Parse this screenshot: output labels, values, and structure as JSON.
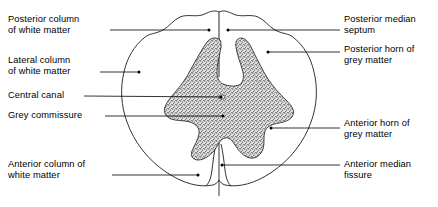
{
  "diagram": {
    "colors": {
      "background": "#ffffff",
      "outline": "#000000",
      "grey_matter_fill": "#d9d9d9",
      "grey_matter_stipple": "#3a3a3a",
      "leader_line": "#000000",
      "text": "#000000"
    }
  },
  "labels": {
    "left": [
      {
        "id": "posterior-column-white-matter",
        "text": "Posterior column\nof white matter",
        "x": 8,
        "y": 14,
        "leader": {
          "x1": 110,
          "y1": 30,
          "x2": 209,
          "y2": 30,
          "dot": "end"
        }
      },
      {
        "id": "lateral-column-white-matter",
        "text": "Lateral column\nof white matter",
        "x": 8,
        "y": 55,
        "leader": {
          "x1": 100,
          "y1": 72,
          "x2": 139,
          "y2": 72,
          "dot": "end"
        }
      },
      {
        "id": "central-canal",
        "text": "Central canal",
        "x": 8,
        "y": 90,
        "leader": {
          "x1": 84,
          "y1": 96,
          "x2": 221,
          "y2": 97,
          "dot": "end"
        }
      },
      {
        "id": "grey-commissure",
        "text": "Grey commissure",
        "x": 8,
        "y": 110,
        "leader": {
          "x1": 105,
          "y1": 116,
          "x2": 223,
          "y2": 116,
          "dot": "end"
        }
      },
      {
        "id": "anterior-column-white-matter",
        "text": "Anterior column of\nwhite matter",
        "x": 8,
        "y": 159,
        "leader": {
          "x1": 112,
          "y1": 175,
          "x2": 198,
          "y2": 175,
          "dot": "end"
        }
      }
    ],
    "right": [
      {
        "id": "posterior-median-septum",
        "text": "Posterior median\nseptum",
        "x": 344,
        "y": 14,
        "leader": {
          "x1": 228,
          "y1": 30,
          "x2": 340,
          "y2": 30,
          "dot": "start"
        }
      },
      {
        "id": "posterior-horn-grey-matter",
        "text": "Posterior horn of\ngrey matter",
        "x": 344,
        "y": 44,
        "leader": {
          "x1": 268,
          "y1": 52,
          "x2": 340,
          "y2": 52,
          "dot": "start"
        }
      },
      {
        "id": "anterior-horn-grey-matter",
        "text": "Anterior horn of\ngrey matter",
        "x": 344,
        "y": 118,
        "leader": {
          "x1": 271,
          "y1": 128,
          "x2": 340,
          "y2": 128,
          "dot": "start"
        }
      },
      {
        "id": "anterior-median-fissure",
        "text": "Anterior median\nfissure",
        "x": 344,
        "y": 159,
        "leader": {
          "x1": 222,
          "y1": 165,
          "x2": 340,
          "y2": 165,
          "dot": "start"
        }
      }
    ]
  },
  "structures": {
    "cord_outline": "outer boundary of spinal cord white matter",
    "grey_matter": "H-shaped / butterfly-shaped stippled grey matter",
    "posterior_median_septum": "vertical midline septum at top",
    "anterior_median_fissure": "deep V-shaped midline notch at bottom",
    "central_canal": "small oval at centre of grey commissure"
  }
}
